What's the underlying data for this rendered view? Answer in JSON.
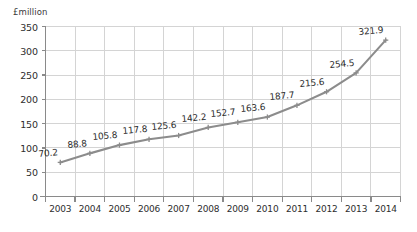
{
  "chart_data": {
    "type": "line",
    "title": "",
    "xlabel": "",
    "ylabel": "£million",
    "ylim": [
      0,
      350
    ],
    "ytick_step": 50,
    "grid": true,
    "legend": null,
    "categories": [
      "2003",
      "2004",
      "2005",
      "2006",
      "2007",
      "2008",
      "2009",
      "2010",
      "2011",
      "2012",
      "2013",
      "2014"
    ],
    "values": [
      70.2,
      88.8,
      105.8,
      117.8,
      125.6,
      142.2,
      152.7,
      163.6,
      187.7,
      215.6,
      254.5,
      321.9
    ],
    "point_labels": [
      "70.2",
      "88.8",
      "105.8",
      "117.8",
      "125.6",
      "142.2",
      "152.7",
      "163.6",
      "187.7",
      "215.6",
      "254.5",
      "321.9"
    ],
    "ytick_labels": [
      "0",
      "50",
      "100",
      "150",
      "200",
      "250",
      "300",
      "350"
    ],
    "series_color": "#8c8c8c",
    "grid_color": "#d4d4d4",
    "axis_color": "#8a8a8a",
    "background": "#ffffff",
    "marker": "cross"
  },
  "axis": {
    "unit_label": "£million"
  },
  "caption": {
    "clipped_text": ""
  }
}
